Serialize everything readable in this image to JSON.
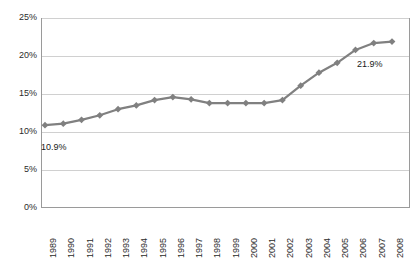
{
  "chart_data": {
    "type": "line",
    "title": "",
    "subtitle": "",
    "xlabel": "",
    "ylabel": "",
    "categories": [
      "1989",
      "1990",
      "1991",
      "1992",
      "1993",
      "1994",
      "1995",
      "1996",
      "1997",
      "1998",
      "1999",
      "2000",
      "2001",
      "2002",
      "2003",
      "2004",
      "2005",
      "2006",
      "2007",
      "2008"
    ],
    "values": [
      10.9,
      11.1,
      11.6,
      12.2,
      13.0,
      13.5,
      14.2,
      14.6,
      14.3,
      13.8,
      13.8,
      13.8,
      13.8,
      14.2,
      16.1,
      17.8,
      19.1,
      20.8,
      21.7,
      21.9
    ],
    "series": [
      {
        "name": "",
        "values": [
          10.9,
          11.1,
          11.6,
          12.2,
          13.0,
          13.5,
          14.2,
          14.6,
          14.3,
          13.8,
          13.8,
          13.8,
          13.8,
          14.2,
          16.1,
          17.8,
          19.1,
          20.8,
          21.7,
          21.9
        ]
      }
    ],
    "ylim": [
      0,
      25
    ],
    "ytick_labels": [
      "0%",
      "5%",
      "10%",
      "15%",
      "20%",
      "25%"
    ],
    "ytick_values": [
      0,
      5,
      10,
      15,
      20,
      25
    ],
    "grid": true,
    "legend": "none",
    "marker": "diamond",
    "series_color": "#808080",
    "gridline_color": "#d0d0d0",
    "border_color": "#9a9a9a",
    "annotations": [
      {
        "label": "10.9%",
        "category": "1989",
        "value": 10.9,
        "position": "below-right"
      },
      {
        "label": "21.9%",
        "category": "2008",
        "value": 21.9,
        "position": "below-left"
      }
    ]
  }
}
